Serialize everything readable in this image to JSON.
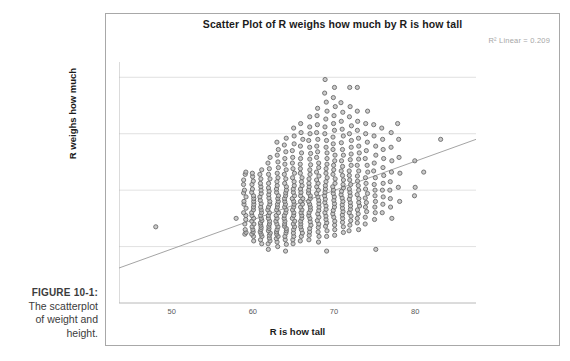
{
  "caption": {
    "label": "FIGURE 10-1:",
    "line1": "The scatterplot",
    "line2": "of weight and",
    "line3": "height."
  },
  "chart_data": {
    "type": "scatter",
    "title": "Scatter Plot of R weighs how much by R is how tall",
    "xlabel": "R is how tall",
    "ylabel": "R weighs how much",
    "annotation": "R² Linear = 0.209",
    "r_squared": 0.209,
    "grid": true,
    "legend": "none",
    "xlim": [
      43.5,
      87.5
    ],
    "ylim": [
      0,
      420
    ],
    "xticks": [
      50,
      60,
      70,
      80
    ],
    "yticks": [
      0,
      100,
      200,
      300,
      400
    ],
    "point_color": "#6a6a6a",
    "point_fill": "#b9b9b9",
    "trendline": {
      "type": "linear",
      "x": [
        43.5,
        87.5
      ],
      "y": [
        62,
        290
      ],
      "color": "#9a9a9a"
    },
    "columns": [
      {
        "x": 48,
        "values": [
          135
        ]
      },
      {
        "x": 58,
        "values": [
          150
        ]
      },
      {
        "x": 59,
        "values": [
          122,
          125,
          130,
          140,
          148,
          155,
          160,
          168,
          175,
          180,
          188,
          195,
          200,
          210,
          218,
          228,
          232
        ]
      },
      {
        "x": 60,
        "values": [
          110,
          118,
          122,
          126,
          130,
          135,
          140,
          145,
          150,
          155,
          160,
          165,
          170,
          175,
          180,
          185,
          190,
          196,
          202,
          210,
          216,
          224,
          230
        ]
      },
      {
        "x": 61,
        "values": [
          105,
          112,
          118,
          122,
          126,
          130,
          134,
          138,
          142,
          146,
          150,
          155,
          160,
          165,
          170,
          176,
          182,
          188,
          194,
          200,
          206,
          212,
          220,
          228,
          236
        ]
      },
      {
        "x": 62,
        "values": [
          95,
          105,
          110,
          115,
          120,
          124,
          128,
          132,
          136,
          140,
          145,
          150,
          155,
          160,
          165,
          170,
          175,
          180,
          186,
          192,
          198,
          204,
          212,
          220,
          228,
          238,
          248,
          258
        ]
      },
      {
        "x": 63,
        "values": [
          100,
          108,
          114,
          118,
          122,
          126,
          130,
          135,
          140,
          145,
          150,
          155,
          160,
          165,
          170,
          175,
          180,
          185,
          190,
          196,
          202,
          208,
          215,
          222,
          230,
          240,
          250,
          262,
          272,
          285
        ]
      },
      {
        "x": 64,
        "values": [
          92,
          104,
          112,
          118,
          124,
          128,
          132,
          136,
          140,
          145,
          150,
          155,
          160,
          165,
          170,
          175,
          180,
          185,
          190,
          195,
          200,
          206,
          212,
          220,
          228,
          236,
          246,
          256,
          268,
          280,
          292
        ]
      },
      {
        "x": 65,
        "values": [
          105,
          112,
          118,
          124,
          130,
          135,
          140,
          145,
          150,
          155,
          160,
          165,
          170,
          175,
          180,
          185,
          190,
          196,
          202,
          208,
          215,
          222,
          230,
          238,
          248,
          258,
          270,
          282,
          296,
          310
        ]
      },
      {
        "x": 66,
        "values": [
          110,
          118,
          124,
          130,
          135,
          140,
          145,
          150,
          155,
          160,
          165,
          170,
          175,
          180,
          185,
          190,
          196,
          202,
          208,
          215,
          222,
          230,
          238,
          246,
          256,
          266,
          278,
          290,
          302,
          318
        ]
      },
      {
        "x": 67,
        "values": [
          112,
          120,
          126,
          132,
          138,
          144,
          150,
          155,
          160,
          165,
          170,
          175,
          180,
          185,
          190,
          195,
          200,
          206,
          212,
          220,
          228,
          236,
          245,
          255,
          265,
          276,
          288,
          300,
          312,
          330
        ]
      },
      {
        "x": 68,
        "values": [
          108,
          118,
          126,
          134,
          140,
          146,
          152,
          158,
          164,
          170,
          176,
          182,
          188,
          194,
          200,
          206,
          212,
          218,
          225,
          232,
          240,
          248,
          258,
          268,
          278,
          290,
          302,
          316,
          332,
          345
        ]
      },
      {
        "x": 69,
        "values": [
          92,
          118,
          128,
          136,
          142,
          148,
          154,
          160,
          166,
          172,
          178,
          184,
          190,
          196,
          202,
          208,
          215,
          222,
          230,
          238,
          246,
          256,
          266,
          276,
          288,
          300,
          312,
          326,
          340,
          356,
          372,
          396
        ]
      },
      {
        "x": 70,
        "values": [
          120,
          130,
          138,
          145,
          152,
          158,
          164,
          170,
          176,
          182,
          188,
          194,
          200,
          206,
          212,
          220,
          228,
          236,
          244,
          252,
          262,
          272,
          282,
          294,
          306,
          318,
          332,
          348,
          364,
          382
        ]
      },
      {
        "x": 71,
        "values": [
          125,
          135,
          143,
          150,
          156,
          162,
          168,
          174,
          180,
          186,
          192,
          198,
          204,
          210,
          218,
          226,
          234,
          242,
          252,
          262,
          272,
          284,
          296,
          308,
          322,
          338,
          355
        ]
      },
      {
        "x": 72,
        "values": [
          128,
          138,
          146,
          154,
          160,
          166,
          172,
          178,
          184,
          190,
          196,
          202,
          210,
          218,
          226,
          234,
          244,
          254,
          264,
          276,
          288,
          300,
          314,
          330,
          348,
          382
        ]
      },
      {
        "x": 73,
        "values": [
          130,
          142,
          150,
          158,
          165,
          172,
          178,
          185,
          192,
          200,
          208,
          216,
          225,
          234,
          244,
          255,
          266,
          278,
          292,
          306,
          322,
          340,
          382
        ]
      },
      {
        "x": 74,
        "values": [
          140,
          152,
          162,
          170,
          178,
          186,
          194,
          202,
          212,
          222,
          232,
          244,
          256,
          270,
          285,
          300,
          318,
          340
        ]
      },
      {
        "x": 75,
        "values": [
          95,
          148,
          160,
          170,
          180,
          190,
          200,
          210,
          222,
          234,
          248,
          262,
          278,
          296,
          316
        ]
      },
      {
        "x": 76,
        "values": [
          160,
          175,
          188,
          200,
          212,
          226,
          240,
          256,
          272,
          290,
          310
        ]
      },
      {
        "x": 77,
        "values": [
          150,
          170,
          185,
          200,
          215,
          232,
          252,
          276,
          302
        ]
      },
      {
        "x": 78,
        "values": [
          180,
          205,
          230,
          258,
          290,
          318
        ]
      },
      {
        "x": 80,
        "values": [
          190,
          205,
          252
        ]
      },
      {
        "x": 81,
        "values": [
          232
        ]
      },
      {
        "x": 83,
        "values": [
          290
        ]
      }
    ]
  }
}
